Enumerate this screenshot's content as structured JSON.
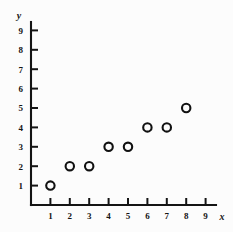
{
  "chart_data": {
    "type": "scatter",
    "title": "",
    "subtitle": "",
    "xlabel": "x",
    "ylabel": "y",
    "xlim": [
      0,
      9.8
    ],
    "ylim": [
      0,
      9.8
    ],
    "xticks": [
      1,
      2,
      3,
      4,
      5,
      6,
      7,
      8,
      9
    ],
    "yticks": [
      1,
      2,
      3,
      4,
      5,
      6,
      7,
      8,
      9
    ],
    "xtick_labels": [
      "1",
      "2",
      "3",
      "4",
      "5",
      "6",
      "7",
      "8",
      "9"
    ],
    "ytick_labels": [
      "1",
      "2",
      "3",
      "4",
      "5",
      "6",
      "7",
      "8",
      "9"
    ],
    "grid": false,
    "legend": false,
    "legend_position": "none",
    "marker_style": "open-circle",
    "marker_color": "#111111",
    "background_color": "#fcfcfc",
    "axis_color": "#141414",
    "points": [
      {
        "x": 1,
        "y": 1
      },
      {
        "x": 2,
        "y": 2
      },
      {
        "x": 3,
        "y": 2
      },
      {
        "x": 4,
        "y": 3
      },
      {
        "x": 5,
        "y": 3
      },
      {
        "x": 6,
        "y": 4
      },
      {
        "x": 7,
        "y": 4
      },
      {
        "x": 8,
        "y": 5
      }
    ],
    "x": [
      1,
      2,
      3,
      4,
      5,
      6,
      7,
      8
    ],
    "values": [
      1,
      2,
      2,
      3,
      3,
      4,
      4,
      5
    ],
    "annotations": []
  }
}
